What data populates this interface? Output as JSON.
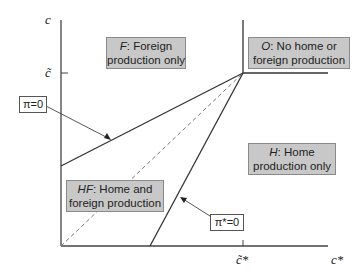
{
  "axes": {
    "y_label": "c",
    "y_tick_label": "c̃",
    "x_label": "c*",
    "x_tick_label": "c̃*"
  },
  "regions": {
    "F": {
      "name": "F",
      "text_line1_suffix": ": Foreign",
      "text_line2": "production only"
    },
    "O": {
      "name": "O",
      "text_line1_suffix": ": No home or",
      "text_line2": "foreign production"
    },
    "H": {
      "name": "H",
      "text_line1_suffix": ": Home",
      "text_line2": "production only"
    },
    "HF": {
      "name": "HF",
      "text_line1_suffix": ": Home and",
      "text_line2": "foreign production"
    }
  },
  "line_labels": {
    "pi": "π=0",
    "pi_star": "π*=0"
  },
  "colors": {
    "line": "#333333",
    "dashed": "#777777",
    "box_fill": "#c8c8c8",
    "box_border": "#8a8a8a"
  }
}
